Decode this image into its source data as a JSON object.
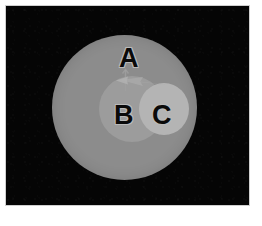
{
  "figure": {
    "title": "",
    "background_color": "#050505",
    "frame_color": "#cfcfcf",
    "canvas_color": "#ffffff",
    "width": 262,
    "height": 226
  },
  "regions": [
    {
      "key": "A",
      "label": "A",
      "shape": "circle",
      "fill": "#8c8c8c",
      "center_x": 125,
      "center_y": 107,
      "radius": 72
    },
    {
      "key": "B",
      "label": "B",
      "shape": "circle",
      "fill": "#9c9c9c",
      "center_x": 126,
      "center_y": 109,
      "radius": 33
    },
    {
      "key": "C",
      "label": "C",
      "shape": "circle",
      "fill": "#b4b4b4",
      "center_x": 158,
      "center_y": 109,
      "radius": 25
    }
  ],
  "annotations": [
    {
      "key": "arrow",
      "type": "arrow",
      "direction": "left",
      "color": "#a8a8a8",
      "tip_x": 110,
      "tip_y": 74,
      "tail_x": 160,
      "tail_y": 80
    },
    {
      "key": "tick",
      "type": "tick-mark",
      "direction": "vertical",
      "color": "#a0a0a0",
      "x": 119,
      "y_top": 64,
      "y_bottom": 86
    }
  ],
  "labels": {
    "a": "A",
    "b": "B",
    "c": "C"
  },
  "colors": {
    "region_a": "#8c8c8c",
    "region_b": "#9c9c9c",
    "region_c": "#b4b4b4",
    "label_fill": "#0a0a0a",
    "label_outline": "#b9b9b9",
    "annotation": "#a8a8a8"
  }
}
